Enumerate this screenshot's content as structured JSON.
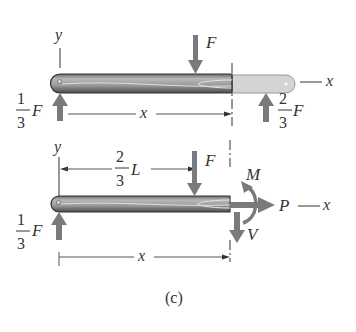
{
  "figure": {
    "caption": "(c)",
    "top_diagram": {
      "y_axis_label": "y",
      "x_axis_label": "x",
      "applied_load_label": "F",
      "left_reaction": {
        "numerator": "1",
        "denominator": "3",
        "symbol": "F"
      },
      "right_reaction": {
        "numerator": "2",
        "denominator": "3",
        "symbol": "F"
      },
      "section_dimension_label": "x"
    },
    "bottom_diagram": {
      "y_axis_label": "y",
      "load_position": {
        "numerator": "2",
        "denominator": "3",
        "symbol": "L"
      },
      "applied_load_label": "F",
      "left_reaction": {
        "numerator": "1",
        "denominator": "3",
        "symbol": "F"
      },
      "moment_label": "M",
      "shear_label": "V",
      "normal_force_label": "P",
      "x_axis_label": "x",
      "section_dimension_label": "x"
    },
    "colors": {
      "arrow": "#7a7a7a",
      "beam_dark": "#555555",
      "beam_light": "#c8c8c8",
      "beam_removed": "#d4d4d4",
      "text": "#333333"
    }
  }
}
